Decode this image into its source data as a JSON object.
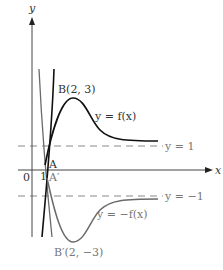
{
  "axes": {
    "x_label": "x",
    "y_label": "y",
    "origin_label": "0",
    "x_tick_label": "1"
  },
  "asymptotes": [
    {
      "label": "y = 1",
      "y": 1
    },
    {
      "label": "y = −1",
      "y": -1
    }
  ],
  "curves": [
    {
      "label": "y = f(x)",
      "color": "#111111"
    },
    {
      "label": "y = −f(x)",
      "color": "#666666"
    }
  ],
  "points": {
    "B": "B(2, 3)",
    "B_prime": "B′(2, −3)",
    "A": "A",
    "A_prime": "A′"
  },
  "colors": {
    "axis": "#444444",
    "curve_f": "#111111",
    "curve_neg_f": "#6a6a6a",
    "dashed": "#888888",
    "text": "#333333"
  }
}
